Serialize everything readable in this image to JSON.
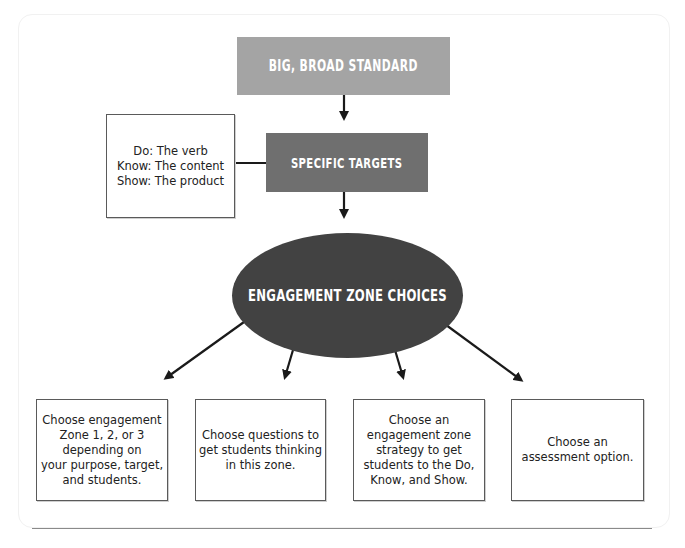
{
  "diagram": {
    "top_box": {
      "label": "BIG, BROAD STANDARD",
      "color": "#a4a4a4"
    },
    "targets_box": {
      "label": "SPECIFIC TARGETS",
      "color": "#6f6f6f"
    },
    "side_box": {
      "lines": [
        "Do: The verb",
        "Know: The content",
        "Show: The product"
      ]
    },
    "center_ellipse": {
      "label": "ENGAGEMENT ZONE CHOICES",
      "color": "#424242"
    },
    "choices": [
      {
        "lines": [
          "Choose engagement",
          "Zone 1, 2, or 3",
          "depending on",
          "your purpose, target,",
          "and students."
        ]
      },
      {
        "lines": [
          "Choose questions to",
          "get students thinking",
          "in this zone."
        ]
      },
      {
        "lines": [
          "Choose an",
          "engagement zone",
          "strategy to get",
          "students to the Do,",
          "Know, and Show."
        ]
      },
      {
        "lines": [
          "Choose an",
          "assessment option."
        ]
      }
    ],
    "arrows": [
      {
        "from": "top_box",
        "to": "targets_box"
      },
      {
        "from": "targets_box",
        "to": "side_box"
      },
      {
        "from": "targets_box",
        "to": "center_ellipse"
      },
      {
        "from": "center_ellipse",
        "to": "choice_1"
      },
      {
        "from": "center_ellipse",
        "to": "choice_2"
      },
      {
        "from": "center_ellipse",
        "to": "choice_3"
      },
      {
        "from": "center_ellipse",
        "to": "choice_4"
      }
    ]
  }
}
